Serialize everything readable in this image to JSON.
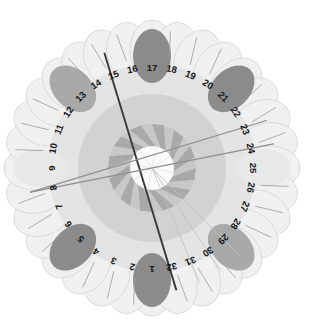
{
  "figure": {
    "type": "radial-petal-rose",
    "title": "",
    "petal_count": 32,
    "center": {
      "x": 152,
      "y": 168
    },
    "colors": {
      "background": "#ffffff",
      "petal_fill": "#f0f0f0",
      "petal_stroke": "#d9d9d9",
      "ring_outer": "#e4e4e4",
      "ring_mid": "#d2d2d2",
      "ring_inner": "#c8c8c8",
      "pinwheel_blade": "#a8a8a8",
      "hub": "#fbfbfb",
      "blob_dark": "#8b8b8b",
      "blob_medium": "#a9a9a9",
      "blob_light": "#d6d6d6",
      "blob_faint": "#e8e8e8",
      "line_dark": "#3a3a3a",
      "line_mid": "#8e8e8e",
      "line_faint": "#c0c0c0",
      "label_text": "#15171a"
    },
    "geometry": {
      "petal_ring_radius": 118,
      "petal_rx": 22,
      "petal_ry": 30,
      "label_radius": 101,
      "ring_outer_radius": 104,
      "ring_mid_radius": 74,
      "ring_inner_radius": 44,
      "hub_radius": 22,
      "blob_rx": 19,
      "blob_ry": 27,
      "blob_radius": 112,
      "start_angle_deg": 90,
      "angle_step_deg": 11.25,
      "direction": "counterclockwise"
    }
  },
  "chart_data": {
    "type": "pie",
    "title": "",
    "subtitle": "",
    "xlabel": "",
    "ylabel": "",
    "legend_position": "none",
    "grid": false,
    "categories": [
      "1",
      "2",
      "3",
      "4",
      "5",
      "6",
      "7",
      "8",
      "9",
      "10",
      "11",
      "12",
      "13",
      "14",
      "15",
      "16",
      "17",
      "18",
      "19",
      "20",
      "21",
      "22",
      "23",
      "24",
      "25",
      "26",
      "27",
      "28",
      "29",
      "30",
      "31",
      "32"
    ],
    "tick_labels": [
      "1",
      "2",
      "3",
      "4",
      "5",
      "6",
      "7",
      "8",
      "9",
      "10",
      "11",
      "12",
      "13",
      "14",
      "15",
      "16",
      "17",
      "18",
      "19",
      "20",
      "21",
      "22",
      "23",
      "24",
      "25",
      "26",
      "27",
      "28",
      "29",
      "30",
      "31",
      "32"
    ],
    "series": [
      {
        "name": "petal-highlight-intensity",
        "values": [
          3,
          0,
          0,
          0,
          3,
          0,
          0,
          0,
          1,
          0,
          0,
          0,
          2,
          0,
          0,
          0,
          3,
          0,
          0,
          0,
          3,
          0,
          0,
          0,
          1,
          0,
          0,
          0,
          2,
          0,
          0,
          0
        ]
      }
    ],
    "highlight_levels": {
      "0": "none",
      "1": "faint",
      "2": "medium",
      "3": "dark"
    },
    "highlighted_petals": [
      1,
      5,
      9,
      13,
      17,
      21,
      25,
      29
    ],
    "annotations": [
      {
        "name": "vector-15-to-32",
        "from_petal": 15,
        "to_petal": 32,
        "weight": "dark"
      },
      {
        "name": "vector-8-to-23",
        "from_petal": 8,
        "to_petal": 23,
        "weight": "mid"
      },
      {
        "name": "vector-8-to-24",
        "from_petal": 8,
        "to_petal": 24,
        "weight": "mid"
      },
      {
        "name": "vector-center-to-31",
        "from_petal": 0,
        "to_petal": 31,
        "weight": "faint"
      },
      {
        "name": "vector-center-to-30",
        "from_petal": 0,
        "to_petal": 30,
        "weight": "faint"
      },
      {
        "name": "vector-center-to-29",
        "from_petal": 0,
        "to_petal": 29,
        "weight": "faint"
      }
    ]
  }
}
